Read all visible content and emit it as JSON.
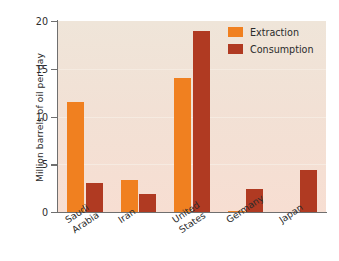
{
  "chart_data": {
    "type": "bar",
    "title": "",
    "xlabel": "",
    "ylabel": "Million barrels of oil per day",
    "categories": [
      "Saudi Arabia",
      "Iran",
      "United States",
      "Germany",
      "Japan"
    ],
    "category_lines": [
      [
        "Saudi",
        "Arabia"
      ],
      [
        "Iran",
        ""
      ],
      [
        "United",
        "States"
      ],
      [
        "Germany",
        ""
      ],
      [
        "Japan",
        ""
      ]
    ],
    "series": [
      {
        "name": "Extraction",
        "color": "#f08020",
        "values": [
          11.5,
          3.4,
          14.0,
          0.1,
          0.0
        ]
      },
      {
        "name": "Consumption",
        "color": "#b03a22",
        "values": [
          3.0,
          1.9,
          19.0,
          2.4,
          4.4
        ]
      }
    ],
    "ylim": [
      0,
      20
    ],
    "yticks": [
      0,
      5,
      10,
      15,
      20
    ],
    "ytick_labels": [
      "0",
      "5",
      "10",
      "15",
      "20"
    ],
    "grid": true,
    "legend_position": "top-right",
    "units": "million barrels of oil per day"
  },
  "legend": {
    "items": [
      {
        "label": "Extraction"
      },
      {
        "label": "Consumption"
      }
    ]
  },
  "colors": {
    "extraction": "#f08020",
    "consumption": "#b03a22",
    "plot_background_top": "#efe5d9",
    "plot_background_bottom": "#f7ded2",
    "page_background": "#ffffff",
    "axis": "#6f6f6f",
    "text": "#2b2b2b"
  }
}
